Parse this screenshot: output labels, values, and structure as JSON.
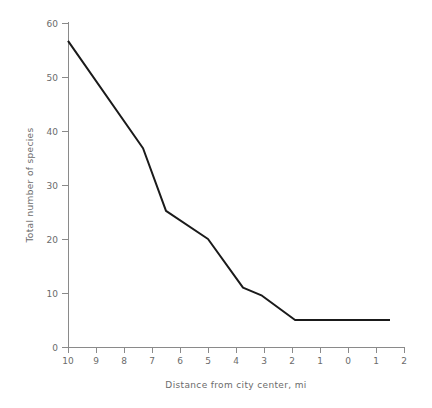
{
  "chart_data": {
    "type": "line",
    "title": "",
    "subtitle": "",
    "xlabel": "Distance from city center, mi",
    "ylabel": "Total number of species",
    "x_tick_labels": [
      "10",
      "9",
      "8",
      "7",
      "6",
      "5",
      "4",
      "3",
      "2",
      "1",
      "0",
      "1",
      "2"
    ],
    "y_tick_labels": [
      "0",
      "10",
      "20",
      "30",
      "40",
      "50",
      "60"
    ],
    "y_ticks": [
      0,
      10,
      20,
      30,
      40,
      50,
      60
    ],
    "ylim": [
      0,
      60
    ],
    "xlim": [
      0,
      12
    ],
    "grid": false,
    "legend": null,
    "legend_position": "none",
    "x_axis_note": "Axis runs 10 down to 0 at city center then back up to 2 on the far side",
    "series": [
      {
        "name": "Total number of species",
        "color": "#1a1a1a",
        "x_positions": [
          0,
          2.68,
          3.5,
          5.0,
          6.25,
          6.93,
          8.11,
          11.5
        ],
        "x_labels": [
          "10",
          "7.3",
          "6.5",
          "5",
          "3.8",
          "3.1",
          "1.9",
          "1.5 (past center)"
        ],
        "values": [
          56.7,
          36.8,
          25.2,
          20.0,
          11.0,
          9.5,
          5.0,
          5.0
        ]
      }
    ],
    "annotations": []
  },
  "style": {
    "background": "#ffffff",
    "axis_color": "#8a8a8a",
    "label_color": "#6b6b6b",
    "line_color": "#1a1a1a"
  }
}
